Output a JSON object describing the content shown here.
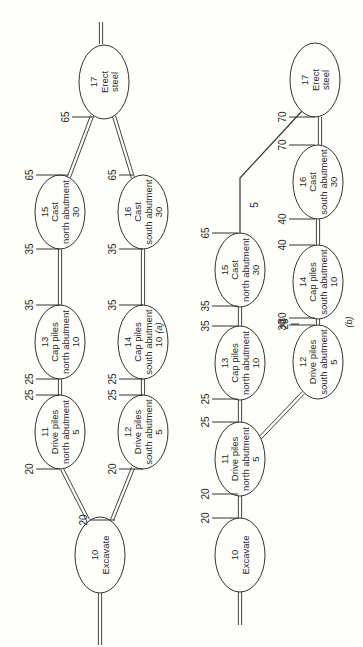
{
  "figure": {
    "orientation_deg": -90,
    "background": "#fdfdf9",
    "line_color": "#333333"
  },
  "diagrams": [
    {
      "caption": "(a)",
      "caption_pos": [
        162,
        328
      ],
      "nodes": [
        {
          "id": "10",
          "lines": [
            "10",
            "Excavate"
          ],
          "cx": 100,
          "cy": 555,
          "rx": 25,
          "ry": 38
        },
        {
          "id": "11",
          "lines": [
            "11",
            "Drive piles",
            "north abutment",
            "5"
          ],
          "cx": 60,
          "cy": 432,
          "rx": 25,
          "ry": 37
        },
        {
          "id": "12",
          "lines": [
            "12",
            "Drive piles",
            "south abutment",
            "5"
          ],
          "cx": 143,
          "cy": 432,
          "rx": 25,
          "ry": 37
        },
        {
          "id": "13",
          "lines": [
            "13",
            "Cap piles",
            "north abutment",
            "10"
          ],
          "cx": 60,
          "cy": 342,
          "rx": 25,
          "ry": 37
        },
        {
          "id": "14",
          "lines": [
            "14",
            "Cap piles",
            "south abutment",
            "10"
          ],
          "cx": 143,
          "cy": 342,
          "rx": 25,
          "ry": 37
        },
        {
          "id": "15",
          "lines": [
            "15",
            "Cast",
            "north abutment",
            "30"
          ],
          "cx": 60,
          "cy": 212,
          "rx": 25,
          "ry": 37
        },
        {
          "id": "16",
          "lines": [
            "16",
            "Cast",
            "south abutment",
            "30"
          ],
          "cx": 143,
          "cy": 212,
          "rx": 25,
          "ry": 37
        },
        {
          "id": "17",
          "lines": [
            "17",
            "Erect",
            "steel"
          ],
          "cx": 104,
          "cy": 82,
          "rx": 25,
          "ry": 37
        }
      ],
      "edges": [
        {
          "type": "double",
          "points": [
            [
              100,
              645
            ],
            [
              100,
              593
            ]
          ]
        },
        {
          "type": "double",
          "points": [
            [
              88,
              520
            ],
            [
              62,
              469
            ]
          ]
        },
        {
          "type": "double",
          "points": [
            [
              112,
              520
            ],
            [
              133,
              468
            ]
          ]
        },
        {
          "type": "double",
          "points": [
            [
              60,
              395
            ],
            [
              60,
              379
            ]
          ]
        },
        {
          "type": "double",
          "points": [
            [
              143,
              395
            ],
            [
              143,
              379
            ]
          ]
        },
        {
          "type": "double",
          "points": [
            [
              60,
              305
            ],
            [
              60,
              249
            ]
          ]
        },
        {
          "type": "double",
          "points": [
            [
              143,
              305
            ],
            [
              143,
              249
            ]
          ]
        },
        {
          "type": "double",
          "points": [
            [
              69,
              177
            ],
            [
              92,
              116
            ]
          ]
        },
        {
          "type": "double",
          "points": [
            [
              133,
              178
            ],
            [
              114,
              116
            ]
          ]
        },
        {
          "type": "double",
          "points": [
            [
              101,
              44
            ],
            [
              101,
              22
            ]
          ]
        }
      ],
      "ticks": [
        {
          "label": "20",
          "x": 90,
          "y": 520,
          "len": 25
        },
        {
          "label": "20",
          "x": 36,
          "y": 469,
          "len": 24
        },
        {
          "label": "20",
          "x": 119,
          "y": 469,
          "len": 24
        },
        {
          "label": "25",
          "x": 36,
          "y": 395,
          "len": 24
        },
        {
          "label": "25",
          "x": 119,
          "y": 395,
          "len": 24
        },
        {
          "label": "25",
          "x": 36,
          "y": 379,
          "len": 24
        },
        {
          "label": "25",
          "x": 119,
          "y": 379,
          "len": 24
        },
        {
          "label": "35",
          "x": 36,
          "y": 305,
          "len": 24
        },
        {
          "label": "35",
          "x": 119,
          "y": 305,
          "len": 24
        },
        {
          "label": "35",
          "x": 36,
          "y": 249,
          "len": 24
        },
        {
          "label": "35",
          "x": 119,
          "y": 249,
          "len": 24
        },
        {
          "label": "65",
          "x": 36,
          "y": 175,
          "len": 32
        },
        {
          "label": "65",
          "x": 119,
          "y": 175,
          "len": 14
        },
        {
          "label": "65",
          "x": 72,
          "y": 117,
          "len": 22
        }
      ]
    },
    {
      "caption": "(b)",
      "caption_pos": [
        352,
        322
      ],
      "nodes": [
        {
          "id": "10",
          "lines": [
            "10",
            "Excavate"
          ],
          "cx": 240,
          "cy": 555,
          "rx": 25,
          "ry": 37
        },
        {
          "id": "11",
          "lines": [
            "11",
            "Drive piles",
            "north abutment",
            "5"
          ],
          "cx": 240,
          "cy": 459,
          "rx": 25,
          "ry": 37
        },
        {
          "id": "12",
          "lines": [
            "12",
            "Drive piles",
            "south abutment",
            "5"
          ],
          "cx": 318,
          "cy": 362,
          "rx": 25,
          "ry": 37
        },
        {
          "id": "13",
          "lines": [
            "13",
            "Cap piles",
            "north abutment",
            "10"
          ],
          "cx": 240,
          "cy": 363,
          "rx": 25,
          "ry": 37
        },
        {
          "id": "14",
          "lines": [
            "14",
            "Cap piles",
            "south abutment",
            "10"
          ],
          "cx": 318,
          "cy": 282,
          "rx": 25,
          "ry": 37
        },
        {
          "id": "15",
          "lines": [
            "15",
            "Cast",
            "north abutment",
            "30"
          ],
          "cx": 240,
          "cy": 270,
          "rx": 25,
          "ry": 37
        },
        {
          "id": "16",
          "lines": [
            "16",
            "Cast",
            "south abutment",
            "30"
          ],
          "cx": 318,
          "cy": 182,
          "rx": 25,
          "ry": 37
        },
        {
          "id": "17",
          "lines": [
            "17",
            "Erect",
            "steel"
          ],
          "cx": 315,
          "cy": 80,
          "rx": 25,
          "ry": 37
        }
      ],
      "edges": [
        {
          "type": "double",
          "points": [
            [
              240,
              625
            ],
            [
              240,
              592
            ]
          ]
        },
        {
          "type": "double",
          "points": [
            [
              240,
              518
            ],
            [
              240,
              496
            ]
          ]
        },
        {
          "type": "double",
          "points": [
            [
              260,
              438
            ],
            [
              303,
              393
            ]
          ]
        },
        {
          "type": "double",
          "points": [
            [
              240,
              422
            ],
            [
              240,
              400
            ]
          ]
        },
        {
          "type": "double",
          "points": [
            [
              318,
              325
            ],
            [
              318,
              319
            ]
          ]
        },
        {
          "type": "double",
          "points": [
            [
              240,
              326
            ],
            [
              240,
              307
            ]
          ]
        },
        {
          "type": "double",
          "points": [
            [
              318,
              245
            ],
            [
              318,
              219
            ]
          ]
        },
        {
          "type": "double",
          "points": [
            [
              320,
              145
            ],
            [
              320,
              117
            ]
          ]
        },
        {
          "type": "single",
          "points": [
            [
              240,
              233
            ],
            [
              240,
              178
            ],
            [
              302,
              111
            ]
          ]
        }
      ],
      "ticks": [
        {
          "label": "20",
          "x": 212,
          "y": 518,
          "len": 26
        },
        {
          "label": "20",
          "x": 212,
          "y": 494,
          "len": 26
        },
        {
          "label": "25",
          "x": 212,
          "y": 422,
          "len": 26
        },
        {
          "label": "25",
          "x": 212,
          "y": 399,
          "len": 26
        },
        {
          "label": "25",
          "x": 291,
          "y": 324,
          "len": 8
        },
        {
          "label": "35",
          "x": 212,
          "y": 326,
          "len": 26
        },
        {
          "label": "35",
          "x": 212,
          "y": 306,
          "len": 26
        },
        {
          "label": "30",
          "x": 289,
          "y": 325,
          "len": 26
        },
        {
          "label": "30",
          "x": 289,
          "y": 318,
          "len": 26
        },
        {
          "label": "40",
          "x": 289,
          "y": 245,
          "len": 26
        },
        {
          "label": "40",
          "x": 289,
          "y": 219,
          "len": 26
        },
        {
          "label": "65",
          "x": 212,
          "y": 233,
          "len": 26
        },
        {
          "label": "70",
          "x": 289,
          "y": 145,
          "len": 26
        },
        {
          "label": "70",
          "x": 289,
          "y": 117,
          "len": 26
        }
      ],
      "annotations": [
        {
          "label": "5",
          "x": 258,
          "y": 205
        }
      ]
    }
  ]
}
